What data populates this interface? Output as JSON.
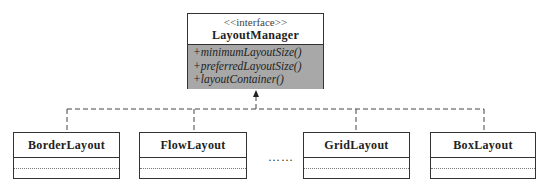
{
  "interface": {
    "stereotype": "<<interface>>",
    "name": "LayoutManager",
    "operations": [
      "+minimumLayoutSize()",
      "+preferredLayoutSize()",
      "+layoutContainer()"
    ]
  },
  "implementations": [
    {
      "name": "BorderLayout"
    },
    {
      "name": "FlowLayout"
    },
    {
      "name": "GridLayout"
    },
    {
      "name": "BoxLayout"
    }
  ],
  "ellipsis": "……",
  "colors": {
    "operations_fill": "#a8a8a8",
    "border": "#333333"
  }
}
